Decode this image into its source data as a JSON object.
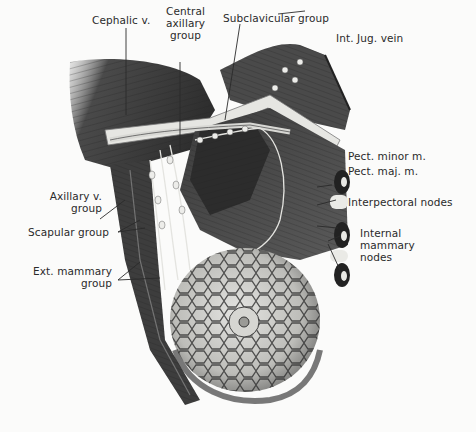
{
  "figure": {
    "labels": {
      "cephalic_v": "Cephalic v.",
      "central_axillary": [
        "Central",
        "axillary",
        "group"
      ],
      "subclavicular": "Subclavicular group",
      "int_jug_vein": "Int. Jug. vein",
      "pect_minor": "Pect. minor m.",
      "pect_maj": "Pect. maj. m.",
      "interpectoral": "Interpectoral nodes",
      "internal_mammary": [
        "Internal",
        "mammary",
        "nodes"
      ],
      "axillary_v": [
        "Axillary v.",
        "group"
      ],
      "scapular": "Scapular group",
      "ext_mammary": [
        "Ext. mammary",
        "group"
      ]
    },
    "colors": {
      "background": "#fbfbfa",
      "ink": "#2a2a2a",
      "muscle_dark": "#3a3a3a",
      "muscle_mid": "#6e6e6e",
      "breast_fill": "#cfcfcc",
      "lymph_node": "#e8e8e4"
    }
  }
}
